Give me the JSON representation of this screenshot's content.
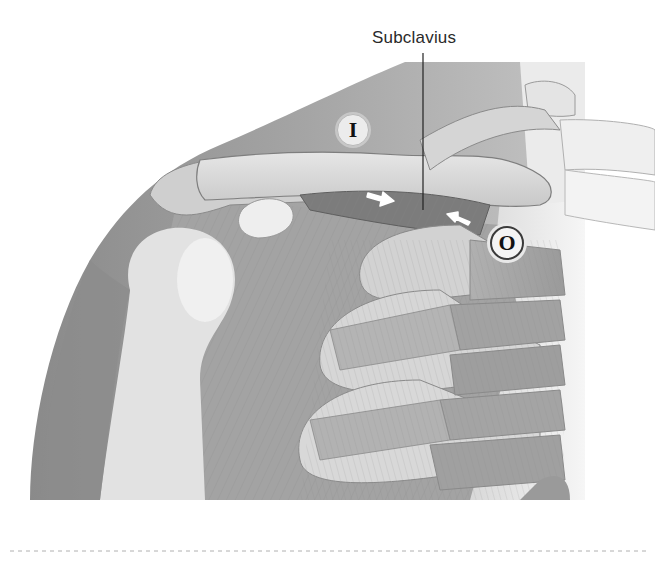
{
  "figure": {
    "muscle_label": "Subclavius",
    "markers": [
      {
        "id": "insertion",
        "letter": "I"
      },
      {
        "id": "origin",
        "letter": "O"
      }
    ],
    "arrows": [
      {
        "direction": "toward-origin",
        "color": "#ffffff"
      },
      {
        "direction": "toward-insertion",
        "color": "#ffffff"
      }
    ],
    "colors": {
      "background": "#ffffff",
      "skin_shadow": "#8e8e8e",
      "bone": "#dcdcdc",
      "muscle": "#9a9a9a",
      "subclavius_muscle": "#7e7e7e",
      "leader_line": "#222222",
      "divider": "#b0b0b0"
    }
  }
}
